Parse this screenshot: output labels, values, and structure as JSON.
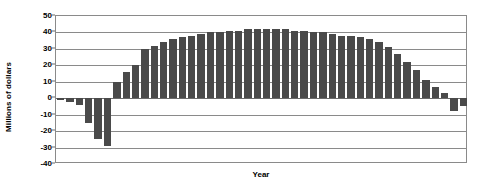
{
  "chart_data": {
    "type": "bar",
    "title": "",
    "xlabel": "Year",
    "ylabel": "Millions of dollars",
    "ylim": [
      -40,
      50
    ],
    "ytick_values": [
      50,
      40,
      30,
      20,
      10,
      0,
      -10,
      -20,
      -30,
      -40
    ],
    "ytick_labels": [
      "50",
      "40",
      "30",
      "20",
      "10",
      "0",
      "-10",
      "-20",
      "-30",
      "-40"
    ],
    "grid": true,
    "legend": false,
    "bar_color": "#4a4a4a",
    "categories": [
      "1",
      "2",
      "3",
      "4",
      "5",
      "6",
      "7",
      "8",
      "9",
      "10",
      "11",
      "12",
      "13",
      "14",
      "15",
      "16",
      "17",
      "18",
      "19",
      "20",
      "21",
      "22",
      "23",
      "24",
      "25",
      "26",
      "27",
      "28",
      "29",
      "30",
      "31",
      "32",
      "33",
      "34",
      "35",
      "36",
      "37",
      "38",
      "39",
      "40",
      "41",
      "42",
      "43",
      "44"
    ],
    "values": [
      -1,
      -2,
      -4,
      -15,
      -25,
      -29,
      10,
      16,
      20,
      30,
      32,
      34,
      36,
      37,
      38,
      39,
      40,
      40,
      41,
      41,
      42,
      42,
      42,
      42,
      42,
      41,
      41,
      40,
      40,
      39,
      38,
      38,
      37,
      36,
      34,
      31,
      27,
      22,
      17,
      11,
      7,
      3,
      -8,
      -5
    ]
  },
  "axis": {
    "x_title": "Year",
    "y_title": "Millions of dollars"
  }
}
